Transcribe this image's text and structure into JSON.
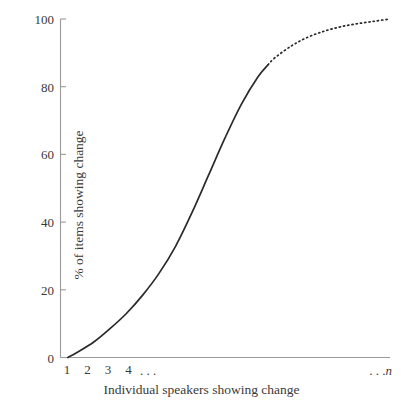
{
  "chart_data": {
    "type": "line",
    "title": "",
    "subtitle": "",
    "xlabel": "Individual speakers showing change",
    "ylabel": "% of items showing change",
    "xlim": [
      0,
      20
    ],
    "ylim": [
      0,
      100
    ],
    "grid": false,
    "legend": null,
    "annotations": [
      "Solid curve from origin through inflection; dotted extension near the asymptote at 100%"
    ],
    "y_ticks": [
      0,
      20,
      40,
      60,
      80,
      100
    ],
    "y_tick_labels": [
      "0",
      "20",
      "40",
      "60",
      "80",
      "100"
    ],
    "x_tick_labels": [
      "1",
      "2",
      "3",
      "4"
    ],
    "x_ellipsis_label": ". . .",
    "x_end_label_prefix": ". . .",
    "x_end_label_symbol": "n",
    "series": [
      {
        "name": "S-curve of change adoption",
        "style": "solid",
        "x": [
          0.45,
          1,
          2,
          3,
          4,
          5,
          6,
          7,
          8,
          9,
          10,
          11,
          12,
          12.6
        ],
        "values": [
          0,
          1.5,
          4.5,
          8.5,
          13,
          18.5,
          25,
          33,
          43,
          54,
          65,
          75,
          83,
          86.5
        ]
      },
      {
        "name": "S-curve projected continuation",
        "style": "dotted",
        "x": [
          12.6,
          13,
          14,
          15,
          16,
          17,
          18,
          19,
          20
        ],
        "values": [
          86.5,
          88.5,
          92,
          94.6,
          96.4,
          97.7,
          98.6,
          99.3,
          100
        ]
      }
    ],
    "colors": {
      "curve": "#2a2a2a",
      "axis": "#9a9a9a",
      "text": "#3a3a3a",
      "background": "#ffffff"
    }
  }
}
